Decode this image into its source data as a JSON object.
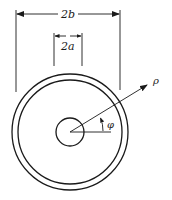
{
  "figure": {
    "type": "coaxial cross-section",
    "labels": {
      "outer_diameter": "2b",
      "inner_diameter": "2a",
      "radial_coord": "ρ",
      "angular_coord": "φ"
    },
    "colors": {
      "stroke": "#1a1a1a",
      "background": "#ffffff"
    }
  }
}
